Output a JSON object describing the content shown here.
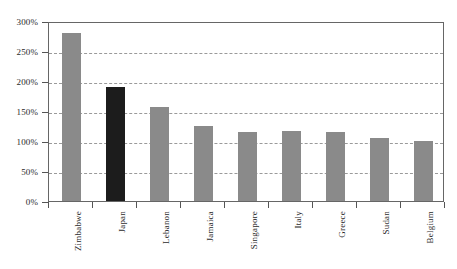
{
  "chart_data": {
    "type": "bar",
    "title": "",
    "subtitle": "",
    "xlabel": "",
    "ylabel": "",
    "categories": [
      "Zimbabwe",
      "Japan",
      "Lebanon",
      "Jamaica",
      "Singapore",
      "Italy",
      "Greece",
      "Sudan",
      "Belgium"
    ],
    "values": [
      280,
      190,
      157,
      125,
      115,
      117,
      115,
      105,
      100
    ],
    "value_unit": "%",
    "ylim": [
      0,
      300
    ],
    "ytick_labels": [
      "0%",
      "50%",
      "100%",
      "150%",
      "200%",
      "250%",
      "300%"
    ],
    "ytick_values": [
      0,
      50,
      100,
      150,
      200,
      250,
      300
    ],
    "grid": true,
    "grid_style": "dashed-horizontal",
    "legend": "none",
    "bar_colors": [
      "#8a8a8a",
      "#1c1c1c",
      "#8a8a8a",
      "#8a8a8a",
      "#8a8a8a",
      "#8a8a8a",
      "#8a8a8a",
      "#8a8a8a",
      "#8a8a8a"
    ],
    "highlight_category": "Japan",
    "colors": {
      "bar_default": "#8a8a8a",
      "bar_highlight": "#1c1c1c",
      "gridline": "#9a9a9a",
      "axis": "#555555",
      "frame": "#666666",
      "text": "#2b2b2b",
      "background": "#ffffff"
    }
  }
}
